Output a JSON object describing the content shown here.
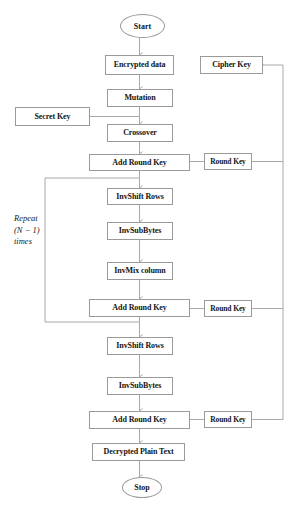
{
  "diagram": {
    "type": "flowchart",
    "canvas": {
      "width": 295,
      "height": 508
    },
    "colors": {
      "background": "#ffffff",
      "line": "#a8a8a8",
      "box_border": "#9a9a9a",
      "text": "#141414"
    },
    "terminators": [
      {
        "id": "start",
        "label": "Start",
        "x": 120,
        "y": 14,
        "w": 45,
        "h": 24,
        "font": 8
      },
      {
        "id": "stop",
        "label": "Stop",
        "x": 122,
        "y": 477,
        "w": 40,
        "h": 21,
        "font": 8
      }
    ],
    "nodes": [
      {
        "id": "encrypted-data",
        "label": "Encrypted data",
        "x": 105,
        "y": 55,
        "w": 69,
        "h": 20,
        "font": 8
      },
      {
        "id": "cipher-key",
        "label": "Cipher  Key",
        "x": 200,
        "y": 56,
        "w": 63,
        "h": 18,
        "font": 8
      },
      {
        "id": "mutation",
        "label": "Mutation",
        "x": 107,
        "y": 89,
        "w": 66,
        "h": 18,
        "font": 8
      },
      {
        "id": "secret-key",
        "label": "Secret Key",
        "x": 15,
        "y": 107,
        "w": 75,
        "h": 19,
        "font": 8
      },
      {
        "id": "crossover",
        "label": "Crossover",
        "x": 107,
        "y": 124,
        "w": 66,
        "h": 18,
        "font": 8
      },
      {
        "id": "add-round-key-1",
        "label": "Add Round Key",
        "x": 89,
        "y": 154,
        "w": 101,
        "h": 17,
        "font": 8
      },
      {
        "id": "round-key-1",
        "label": "Round Key",
        "x": 204,
        "y": 153,
        "w": 48,
        "h": 17,
        "font": 7.5
      },
      {
        "id": "invshift-rows-1",
        "label": "InvShift Rows",
        "x": 107,
        "y": 188,
        "w": 66,
        "h": 17,
        "font": 8
      },
      {
        "id": "invsubbytes-1",
        "label": "InvSubBytes",
        "x": 107,
        "y": 222,
        "w": 66,
        "h": 18,
        "font": 8
      },
      {
        "id": "invmix-column",
        "label": "InvMix column",
        "x": 107,
        "y": 262,
        "w": 66,
        "h": 18,
        "font": 8
      },
      {
        "id": "add-round-key-2",
        "label": "Add Round Key",
        "x": 89,
        "y": 299,
        "w": 101,
        "h": 18,
        "font": 8
      },
      {
        "id": "round-key-2",
        "label": "Round Key",
        "x": 204,
        "y": 300,
        "w": 48,
        "h": 17,
        "font": 7.5
      },
      {
        "id": "invshift-rows-2",
        "label": "InvShift Rows",
        "x": 107,
        "y": 337,
        "w": 66,
        "h": 18,
        "font": 8
      },
      {
        "id": "invsubbytes-2",
        "label": "InvSubBytes",
        "x": 107,
        "y": 377,
        "w": 66,
        "h": 18,
        "font": 8
      },
      {
        "id": "add-round-key-3",
        "label": "Add Round Key",
        "x": 89,
        "y": 411,
        "w": 101,
        "h": 18,
        "font": 8
      },
      {
        "id": "round-key-3",
        "label": "Round Key",
        "x": 204,
        "y": 411,
        "w": 48,
        "h": 17,
        "font": 7.5
      },
      {
        "id": "decrypted-plain-text",
        "label": "Decrypted Plain Text",
        "x": 92,
        "y": 443,
        "w": 93,
        "h": 18,
        "font": 8
      }
    ],
    "loop_annotation": {
      "id": "repeat-loop-label",
      "lines": [
        "Repeat",
        "(N − 1)",
        "times"
      ],
      "x": 14,
      "y": 213
    }
  }
}
